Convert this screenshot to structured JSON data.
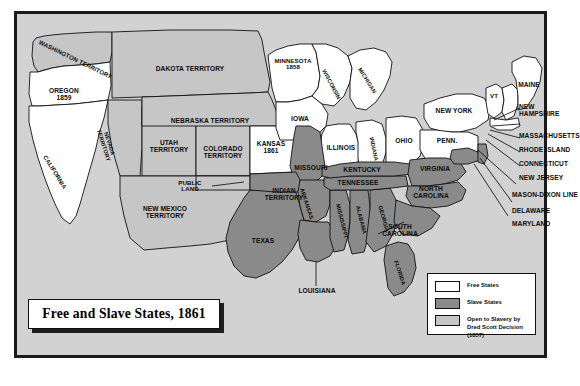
{
  "title": {
    "text": "Free and Slave States, 1861"
  },
  "legend": {
    "items": [
      {
        "swatch": "free",
        "color": "#ffffff",
        "label": "Free States"
      },
      {
        "swatch": "slave",
        "color": "#8a8a8a",
        "label": "Slave States"
      },
      {
        "swatch": "open",
        "color": "#c6c6c6",
        "label": "Open to Slavery by\nDred Scott Decision (1857)"
      }
    ]
  },
  "colors": {
    "free_states": "#ffffff",
    "slave_states": "#8a8a8a",
    "open_to_slavery": "#c6c6c6",
    "background": "#d2d2d2",
    "frame": "#1a1a1a",
    "outline": "#111111",
    "text": "#0b0b0b"
  },
  "map": {
    "free_states": [
      {
        "name": "OREGON 1859",
        "label": "OREGON\n1859"
      },
      {
        "name": "CALIFORNIA",
        "label": "CALIFORNIA"
      },
      {
        "name": "KANSAS 1861",
        "label": "KANSAS\n1861"
      },
      {
        "name": "MINNESOTA 1858",
        "label": "MINNESOTA\n1858"
      },
      {
        "name": "IOWA",
        "label": "IOWA"
      },
      {
        "name": "WISCONSIN",
        "label": "WISCONSIN"
      },
      {
        "name": "MICHIGAN",
        "label": "MICHIGAN"
      },
      {
        "name": "ILLINOIS",
        "label": "ILLINOIS"
      },
      {
        "name": "INDIANA",
        "label": "INDIANA"
      },
      {
        "name": "OHIO",
        "label": "OHIO"
      },
      {
        "name": "NEW YORK",
        "label": "NEW YORK"
      },
      {
        "name": "PENN.",
        "label": "PENN."
      },
      {
        "name": "VT",
        "label": "VT"
      },
      {
        "name": "MAINE",
        "label": "MAINE"
      },
      {
        "name": "NEW HAMPSHIRE",
        "label": "NEW\nHAMPSHIRE"
      },
      {
        "name": "MASSACHUSETTS",
        "label": "MASSACHUSETTS"
      },
      {
        "name": "RHODE ISLAND",
        "label": "RHODE ISLAND"
      },
      {
        "name": "CONNECTICUT",
        "label": "CONNECTICUT"
      },
      {
        "name": "NEW JERSEY",
        "label": "NEW JERSEY"
      }
    ],
    "slave_states": [
      {
        "name": "TEXAS",
        "label": "TEXAS"
      },
      {
        "name": "ARKANSAS",
        "label": "ARKANSAS"
      },
      {
        "name": "LOUISIANA",
        "label": "LOUISIANA"
      },
      {
        "name": "MISSISSIPPI",
        "label": "MISSISSIPPI"
      },
      {
        "name": "ALABAMA",
        "label": "ALABAMA"
      },
      {
        "name": "GEORGIA",
        "label": "GEORGIA"
      },
      {
        "name": "FLORIDA",
        "label": "FLORIDA"
      },
      {
        "name": "TENNESSEE",
        "label": "TENNESSEE"
      },
      {
        "name": "KENTUCKY",
        "label": "KENTUCKY"
      },
      {
        "name": "MISSOURI",
        "label": "MISSOURI"
      },
      {
        "name": "VIRGINIA",
        "label": "VIRGINIA"
      },
      {
        "name": "NORTH CAROLINA",
        "label": "NORTH\nCAROLINA"
      },
      {
        "name": "SOUTH CAROLINA",
        "label": "SOUTH\nCAROLINA"
      },
      {
        "name": "DELAWARE",
        "label": "DELAWARE"
      },
      {
        "name": "MARYLAND",
        "label": "MARYLAND"
      }
    ],
    "territories": [
      {
        "name": "WASHINGTON TERRITORY",
        "label": "WASHINGTON TERRITORY"
      },
      {
        "name": "DAKOTA TERRITORY",
        "label": "DAKOTA TERRITORY"
      },
      {
        "name": "NEBRASKA TERRITORY",
        "label": "NEBRASKA TERRITORY"
      },
      {
        "name": "NEVADA TERRITORY",
        "label": "NEVADA\nTERRITORY"
      },
      {
        "name": "UTAH TERRITORY",
        "label": "UTAH\nTERRITORY"
      },
      {
        "name": "COLORADO TERRITORY",
        "label": "COLORADO\nTERRITORY"
      },
      {
        "name": "NEW MEXICO TERRITORY",
        "label": "NEW MEXICO\nTERRITORY"
      },
      {
        "name": "INDIAN TERRITORY",
        "label": "INDIAN\nTERRITORY"
      },
      {
        "name": "PUBLIC LAND",
        "label": "PUBLIC\nLAND"
      }
    ],
    "annotations": [
      {
        "name": "MASON-DIXON LINE",
        "label": "MASON-DIXON LINE"
      }
    ]
  }
}
